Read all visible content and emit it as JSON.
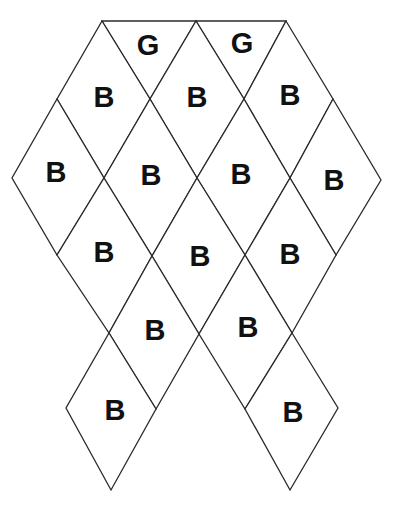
{
  "diagram": {
    "title": "",
    "colors": {
      "stroke": "#2a2a2a",
      "fill": "#ffffff",
      "text": "#111111"
    },
    "cells": [
      {
        "id": "g1",
        "shape": "triangle",
        "label": "G",
        "points": [
          [
            102,
            21
          ],
          [
            196,
            21
          ],
          [
            150,
            99
          ]
        ],
        "label_pos": [
          148,
          45
        ]
      },
      {
        "id": "g2",
        "shape": "triangle",
        "label": "G",
        "points": [
          [
            196,
            21
          ],
          [
            286,
            21
          ],
          [
            244,
            99
          ]
        ],
        "label_pos": [
          242,
          43
        ]
      },
      {
        "id": "b1",
        "shape": "rhombus",
        "label": "B",
        "points": [
          [
            102,
            21
          ],
          [
            150,
            99
          ],
          [
            104,
            178
          ],
          [
            57,
            99
          ]
        ],
        "label_pos": [
          104,
          97
        ]
      },
      {
        "id": "b2",
        "shape": "rhombus",
        "label": "B",
        "points": [
          [
            196,
            21
          ],
          [
            244,
            99
          ],
          [
            197,
            178
          ],
          [
            150,
            99
          ]
        ],
        "label_pos": [
          197,
          97
        ]
      },
      {
        "id": "b3",
        "shape": "rhombus",
        "label": "B",
        "points": [
          [
            286,
            21
          ],
          [
            333,
            99
          ],
          [
            290,
            178
          ],
          [
            244,
            99
          ]
        ],
        "label_pos": [
          290,
          95
        ]
      },
      {
        "id": "b4",
        "shape": "rhombus",
        "label": "B",
        "points": [
          [
            57,
            99
          ],
          [
            104,
            178
          ],
          [
            57,
            255
          ],
          [
            12,
            178
          ]
        ],
        "label_pos": [
          56,
          172
        ]
      },
      {
        "id": "b5",
        "shape": "rhombus",
        "label": "B",
        "points": [
          [
            150,
            99
          ],
          [
            197,
            178
          ],
          [
            152,
            256
          ],
          [
            104,
            178
          ]
        ],
        "label_pos": [
          151,
          175
        ]
      },
      {
        "id": "b6",
        "shape": "rhombus",
        "label": "B",
        "points": [
          [
            244,
            99
          ],
          [
            290,
            178
          ],
          [
            245,
            255
          ],
          [
            197,
            178
          ]
        ],
        "label_pos": [
          241,
          174
        ]
      },
      {
        "id": "b7",
        "shape": "rhombus",
        "label": "B",
        "points": [
          [
            333,
            99
          ],
          [
            381,
            180
          ],
          [
            336,
            255
          ],
          [
            290,
            178
          ]
        ],
        "label_pos": [
          334,
          180
        ]
      },
      {
        "id": "b8",
        "shape": "rhombus",
        "label": "B",
        "points": [
          [
            104,
            178
          ],
          [
            152,
            256
          ],
          [
            109,
            333
          ],
          [
            57,
            255
          ]
        ],
        "label_pos": [
          104,
          252
        ]
      },
      {
        "id": "b9",
        "shape": "rhombus",
        "label": "B",
        "points": [
          [
            197,
            178
          ],
          [
            245,
            255
          ],
          [
            199,
            334
          ],
          [
            152,
            256
          ]
        ],
        "label_pos": [
          200,
          256
        ]
      },
      {
        "id": "b10",
        "shape": "rhombus",
        "label": "B",
        "points": [
          [
            290,
            178
          ],
          [
            336,
            255
          ],
          [
            292,
            333
          ],
          [
            245,
            255
          ]
        ],
        "label_pos": [
          290,
          254
        ]
      },
      {
        "id": "b11",
        "shape": "rhombus",
        "label": "B",
        "points": [
          [
            152,
            256
          ],
          [
            199,
            334
          ],
          [
            156,
            409
          ],
          [
            109,
            333
          ]
        ],
        "label_pos": [
          155,
          330
        ]
      },
      {
        "id": "b12",
        "shape": "rhombus",
        "label": "B",
        "points": [
          [
            245,
            255
          ],
          [
            292,
            333
          ],
          [
            245,
            409
          ],
          [
            199,
            334
          ]
        ],
        "label_pos": [
          248,
          327
        ]
      },
      {
        "id": "b13",
        "shape": "rhombus",
        "label": "B",
        "points": [
          [
            109,
            333
          ],
          [
            156,
            409
          ],
          [
            111,
            490
          ],
          [
            66,
            408
          ]
        ],
        "label_pos": [
          115,
          410
        ]
      },
      {
        "id": "b14",
        "shape": "rhombus",
        "label": "B",
        "points": [
          [
            292,
            333
          ],
          [
            338,
            408
          ],
          [
            290,
            490
          ],
          [
            245,
            409
          ]
        ],
        "label_pos": [
          293,
          412
        ]
      }
    ]
  }
}
